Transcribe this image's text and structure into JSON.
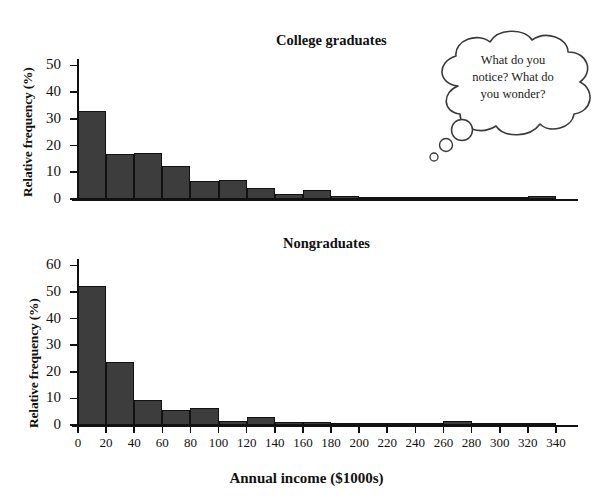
{
  "figure": {
    "xaxis_title": "Annual income ($1000s)",
    "yaxis_title": "Relative frequency (%)"
  },
  "annotation": {
    "name": "thought-bubble",
    "line1": "What do you",
    "line2": "notice? What do",
    "line3": "you wonder?"
  },
  "colors": {
    "bar_fill": "#3d3d3d",
    "bar_stroke": "#111111",
    "axis": "#111111",
    "background": "#ffffff"
  },
  "chart_data": [
    {
      "type": "bar",
      "title": "College graduates",
      "xlabel": "Annual income ($1000s)",
      "ylabel": "Relative frequency (%)",
      "xlim": [
        0,
        350
      ],
      "ylim": [
        0,
        55
      ],
      "yticks": [
        0,
        10,
        20,
        30,
        40,
        50
      ],
      "xticks": [
        0,
        20,
        40,
        60,
        80,
        100,
        120,
        140,
        160,
        180,
        200,
        220,
        240,
        260,
        280,
        300,
        320,
        340
      ],
      "bin_width": 20,
      "grid": false,
      "legend": "none",
      "bins": [
        {
          "x0": 0,
          "x1": 20,
          "value": 33.0
        },
        {
          "x0": 20,
          "x1": 40,
          "value": 17.0
        },
        {
          "x0": 40,
          "x1": 60,
          "value": 17.4
        },
        {
          "x0": 60,
          "x1": 80,
          "value": 12.3
        },
        {
          "x0": 80,
          "x1": 100,
          "value": 6.8
        },
        {
          "x0": 100,
          "x1": 120,
          "value": 7.0
        },
        {
          "x0": 120,
          "x1": 140,
          "value": 4.0
        },
        {
          "x0": 140,
          "x1": 160,
          "value": 2.0
        },
        {
          "x0": 160,
          "x1": 180,
          "value": 3.2
        },
        {
          "x0": 180,
          "x1": 200,
          "value": 1.3
        },
        {
          "x0": 200,
          "x1": 220,
          "value": 0.8
        },
        {
          "x0": 220,
          "x1": 240,
          "value": 0.5
        },
        {
          "x0": 240,
          "x1": 260,
          "value": 0.4
        },
        {
          "x0": 260,
          "x1": 280,
          "value": 0.3
        },
        {
          "x0": 280,
          "x1": 300,
          "value": 0.2
        },
        {
          "x0": 300,
          "x1": 320,
          "value": 0.2
        },
        {
          "x0": 320,
          "x1": 340,
          "value": 1.2
        }
      ]
    },
    {
      "type": "bar",
      "title": "Nongraduates",
      "xlabel": "Annual income ($1000s)",
      "ylabel": "Relative frequency (%)",
      "xlim": [
        0,
        350
      ],
      "ylim": [
        0,
        62
      ],
      "yticks": [
        0,
        10,
        20,
        30,
        40,
        50,
        60
      ],
      "xticks": [
        0,
        20,
        40,
        60,
        80,
        100,
        120,
        140,
        160,
        180,
        200,
        220,
        240,
        260,
        280,
        300,
        320,
        340
      ],
      "bin_width": 20,
      "grid": false,
      "legend": "none",
      "bins": [
        {
          "x0": 0,
          "x1": 20,
          "value": 52.3
        },
        {
          "x0": 20,
          "x1": 40,
          "value": 23.6
        },
        {
          "x0": 40,
          "x1": 60,
          "value": 9.3
        },
        {
          "x0": 60,
          "x1": 80,
          "value": 5.5
        },
        {
          "x0": 80,
          "x1": 100,
          "value": 6.4
        },
        {
          "x0": 100,
          "x1": 120,
          "value": 1.5
        },
        {
          "x0": 120,
          "x1": 140,
          "value": 3.0
        },
        {
          "x0": 140,
          "x1": 160,
          "value": 1.0
        },
        {
          "x0": 160,
          "x1": 180,
          "value": 1.0
        },
        {
          "x0": 180,
          "x1": 200,
          "value": 0.3
        },
        {
          "x0": 200,
          "x1": 220,
          "value": 0.2
        },
        {
          "x0": 220,
          "x1": 240,
          "value": 0.2
        },
        {
          "x0": 240,
          "x1": 260,
          "value": 0.2
        },
        {
          "x0": 260,
          "x1": 280,
          "value": 1.4
        },
        {
          "x0": 280,
          "x1": 300,
          "value": 0.2
        },
        {
          "x0": 300,
          "x1": 320,
          "value": 0.1
        },
        {
          "x0": 320,
          "x1": 340,
          "value": 0.1
        }
      ]
    }
  ]
}
